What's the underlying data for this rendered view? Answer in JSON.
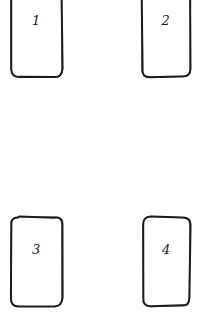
{
  "canvas": {
    "width": 206,
    "height": 329,
    "background": "#ffffff"
  },
  "style": {
    "stroke_color": "#1c1c1c",
    "stroke_width": 2,
    "corner_radius": 8,
    "label_color": "#1a1a1a",
    "label_font_size": 13
  },
  "cards": [
    {
      "id": "card-1",
      "label": "1",
      "x": 11,
      "y": -20,
      "width": 51,
      "height": 97,
      "clipped_top": true,
      "label_offset_y": 34
    },
    {
      "id": "card-2",
      "label": "2",
      "x": 142,
      "y": -20,
      "width": 48,
      "height": 97,
      "clipped_top": true,
      "label_offset_y": 34
    },
    {
      "id": "card-3",
      "label": "3",
      "x": 11,
      "y": 217,
      "width": 51,
      "height": 89,
      "clipped_top": false,
      "label_offset_y": 26
    },
    {
      "id": "card-4",
      "label": "4",
      "x": 143,
      "y": 217,
      "width": 47,
      "height": 89,
      "clipped_top": false,
      "label_offset_y": 26
    }
  ]
}
